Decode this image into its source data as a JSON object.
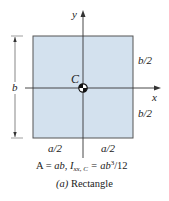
{
  "diagram": {
    "shape": "rectangle",
    "fill_color": "#d3e1ee",
    "stroke_color": "#555555",
    "axis_color": "#333333",
    "labels": {
      "x_axis": "x",
      "y_axis": "y",
      "centroid": "C",
      "height": "b",
      "half_height_top": "b/2",
      "half_height_bottom": "b/2",
      "half_width_left": "a/2",
      "half_width_right": "a/2"
    },
    "formula": {
      "area_lhs": "A = ",
      "area_rhs": "ab",
      "sep": ",  ",
      "inertia_symbol": "I",
      "inertia_subscript": "xx, C",
      "inertia_eq": " = ab",
      "inertia_exp": "3",
      "inertia_tail": "/12"
    },
    "caption": {
      "letter": "(a)",
      "title": " Rectangle"
    }
  }
}
